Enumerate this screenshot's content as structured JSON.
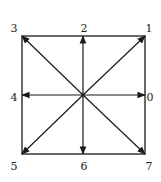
{
  "diagram": {
    "type": "direction-code-square",
    "center": [
      83,
      95
    ],
    "square": {
      "x1": 22,
      "y1": 36,
      "x2": 145,
      "y2": 154
    },
    "line_color": "#1a1a1a",
    "directions": [
      {
        "label": "0",
        "tip": [
          145,
          95
        ],
        "label_pos": [
          150,
          97
        ]
      },
      {
        "label": "1",
        "tip": [
          145,
          36
        ],
        "label_pos": [
          149,
          28
        ]
      },
      {
        "label": "2",
        "tip": [
          83,
          36
        ],
        "label_pos": [
          84,
          28
        ]
      },
      {
        "label": "3",
        "tip": [
          22,
          36
        ],
        "label_pos": [
          14,
          28
        ]
      },
      {
        "label": "4",
        "tip": [
          22,
          95
        ],
        "label_pos": [
          14,
          97
        ]
      },
      {
        "label": "5",
        "tip": [
          22,
          154
        ],
        "label_pos": [
          14,
          166
        ]
      },
      {
        "label": "6",
        "tip": [
          83,
          154
        ],
        "label_pos": [
          84,
          166
        ]
      },
      {
        "label": "7",
        "tip": [
          145,
          154
        ],
        "label_pos": [
          149,
          166
        ]
      }
    ]
  }
}
